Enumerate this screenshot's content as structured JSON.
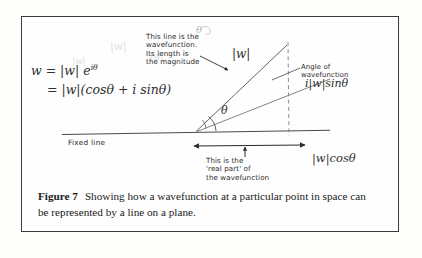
{
  "figure": {
    "caption_label": "Figure 7",
    "caption_text": "Showing how a wavefunction at a particular point in space can be represented by a line on a plane."
  },
  "diagram": {
    "equation_line_1": "w = |w| e",
    "equation_exponent": "iθ",
    "equation_line_2": "= |w|(cosθ + i sinθ)",
    "magnitude_label": "|w|",
    "imaginary_part_label": "i|w|sinθ",
    "real_part_label": "|w|cosθ",
    "angle_symbol": "θ",
    "angle_symbol_faint": "θ",
    "fixed_line_label": "Fixed line",
    "annotation_wavefunction": "This line is the\nwavefunction.\nIts length is\nthe magnitude",
    "annotation_angle": "Angle of\nwavefunction",
    "annotation_real_part": "This is the\n'real part' of\nthe wavefunction",
    "smudge_text": "|w|"
  },
  "colors": {
    "ink": "#2b2b2b",
    "frame": "#3c3c3c",
    "paper": "#fdfdfc",
    "caption_ink": "#1a1a1a",
    "showthrough": "#e3e1dd"
  }
}
